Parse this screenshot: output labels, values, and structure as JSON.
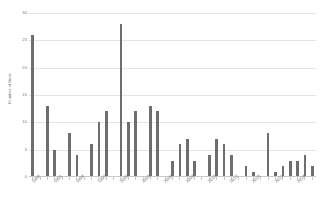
{
  "chart_data": {
    "type": "bar",
    "title": "",
    "xlabel": "",
    "ylabel": "Number of finds",
    "ylim": [
      0,
      30
    ],
    "ytick_labels": [
      "30",
      "25",
      "20",
      "15",
      "10",
      "5",
      "0"
    ],
    "ytick_values": [
      30,
      25,
      20,
      15,
      10,
      5,
      0
    ],
    "grid": true,
    "legend": "none",
    "bar_color": "#6e6e6e",
    "gridline_color": "#e4e4e4",
    "axis_color": "#c9c9c9",
    "label_rotation": -45,
    "categories": [
      "1988",
      "1989",
      "1990",
      "1991",
      "1992",
      "1993",
      "1994",
      "1995",
      "1996",
      "1997",
      "1998",
      "1999",
      "2000",
      "2001",
      "2002",
      "2003",
      "2004",
      "2005",
      "2006",
      "2007",
      "2008",
      "2009",
      "2010",
      "2011",
      "2012",
      "2013",
      "2014",
      "2015",
      "2016",
      "2017",
      "2018",
      "2019",
      "2020",
      "2021",
      "2022",
      "2023",
      "2024",
      "2025",
      "2026"
    ],
    "visible_tick_labels": [
      "1988",
      "",
      "",
      "1991",
      "",
      "",
      "1994",
      "",
      "",
      "1997",
      "",
      "",
      "2000",
      "",
      "",
      "2003",
      "",
      "",
      "2006",
      "",
      "",
      "2009",
      "",
      "",
      "2012",
      "",
      "",
      "2015",
      "",
      "",
      "2018",
      "",
      "",
      "2021",
      "",
      "",
      "2024",
      "",
      ""
    ],
    "values": [
      26,
      0,
      13,
      5,
      0,
      8,
      4,
      0,
      6,
      10,
      12,
      0,
      28,
      10,
      12,
      0,
      13,
      12,
      0,
      3,
      6,
      7,
      3,
      0,
      4,
      7,
      6,
      4,
      0,
      2,
      1,
      0,
      8,
      1,
      2,
      3,
      3,
      4,
      2
    ]
  }
}
